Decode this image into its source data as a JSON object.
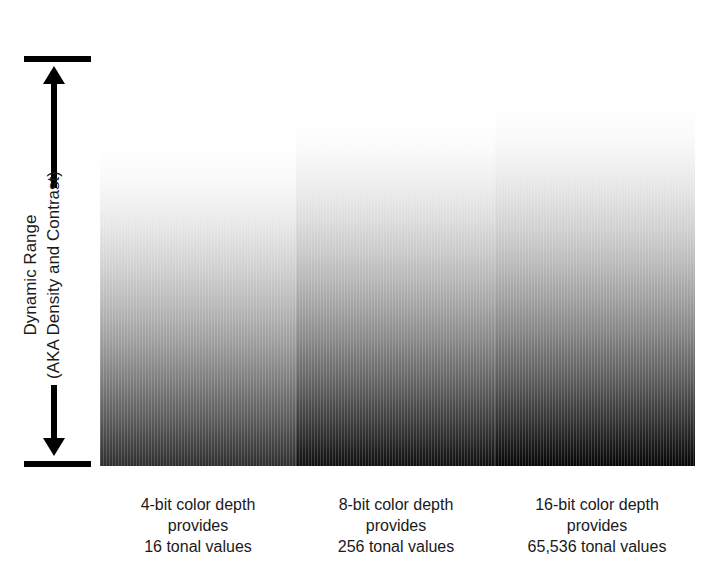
{
  "figure": {
    "width": 718,
    "height": 574,
    "background": "#ffffff",
    "ink_color": "#1a1a1a"
  },
  "axis": {
    "name": "dynamic-range-axis",
    "label_line_1": "Dynamic Range",
    "label_line_2": "(AKA Density and Contrast)",
    "orientation": "vertical",
    "arrow_style": "double-headed",
    "cap_color": "#000000"
  },
  "chart_data": {
    "type": "bar",
    "title": "",
    "subtitle": "",
    "xlabel": "",
    "ylabel": "Dynamic Range (AKA Density and Contrast)",
    "grid": false,
    "legend": "none",
    "note": "Three vertical white-to-black gradient swatches of increasing height and increasing tonal depth, illustrating how greater color depth yields a larger dynamic range.",
    "categories": [
      "4-bit color depth",
      "8-bit color depth",
      "16-bit color depth"
    ],
    "values": [
      16,
      256,
      65536
    ],
    "value_labels": [
      "16 tonal values",
      "256 tonal values",
      "65,536 tonal values"
    ],
    "series": [
      {
        "name": "dynamic range (relative swatch height, px)",
        "values": [
          321,
          346,
          361
        ]
      },
      {
        "name": "darkest tone reached (hex)",
        "values": [
          "#2f2f2f",
          "#101010",
          "#060606"
        ]
      }
    ],
    "bars": [
      {
        "id": "bar-4bit",
        "bits": 4,
        "tonal_values": 16,
        "tonal_values_label": "16 tonal values",
        "top_color": "#ffffff",
        "bottom_color": "#2f2f2f",
        "x": 100,
        "width": 196,
        "top": 145,
        "bottom": 466,
        "height": 321
      },
      {
        "id": "bar-8bit",
        "bits": 8,
        "tonal_values": 256,
        "tonal_values_label": "256 tonal values",
        "top_color": "#ffffff",
        "bottom_color": "#101010",
        "x": 296,
        "width": 199,
        "top": 120,
        "bottom": 466,
        "height": 346
      },
      {
        "id": "bar-16bit",
        "bits": 16,
        "tonal_values": 65536,
        "tonal_values_label": "65,536 tonal values",
        "top_color": "#ffffff",
        "bottom_color": "#060606",
        "x": 495,
        "width": 200,
        "top": 105,
        "bottom": 466,
        "height": 361
      }
    ]
  },
  "captions": [
    {
      "line1": "4-bit color depth",
      "line2": "provides",
      "line3": "16 tonal values"
    },
    {
      "line1": "8-bit color depth",
      "line2": "provides",
      "line3": "256 tonal values"
    },
    {
      "line1": "16-bit color depth",
      "line2": "provides",
      "line3": "65,536 tonal values"
    }
  ]
}
